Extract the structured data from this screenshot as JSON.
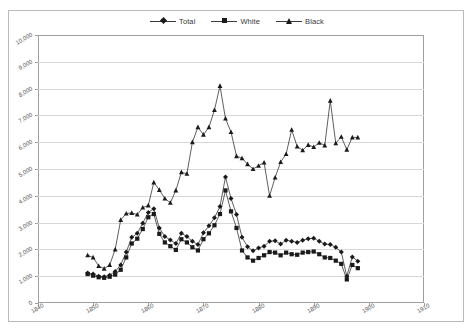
{
  "figure": {
    "background": "#ffffff",
    "frame_color": "#b9b9b9",
    "plot_border_color": "#9f9f9f",
    "grid_color": "#d8d8d8",
    "series_color": "#1a1a1a"
  },
  "legend": {
    "position": "top-center",
    "items": [
      {
        "label": "Total",
        "marker": "diamond"
      },
      {
        "label": "White",
        "marker": "square"
      },
      {
        "label": "Black",
        "marker": "triangle"
      }
    ]
  },
  "chart_data": {
    "type": "line",
    "title": "",
    "subtitle": "",
    "xlabel": "",
    "ylabel": "",
    "xlim": [
      1840,
      1910
    ],
    "ylim": [
      0,
      10000
    ],
    "grid": true,
    "legend_position": "top-center",
    "xticks": [
      "1840",
      "1850",
      "1860",
      "1870",
      "1880",
      "1890",
      "1900",
      "1910"
    ],
    "xtick_values": [
      1840,
      1850,
      1860,
      1870,
      1880,
      1890,
      1900,
      1910
    ],
    "yticks": [
      "0",
      "1,000",
      "2,000",
      "3,000",
      "4,000",
      "5,000",
      "6,000",
      "7,000",
      "8,000",
      "9,000",
      "10,000"
    ],
    "ytick_values": [
      0,
      1000,
      2000,
      3000,
      4000,
      5000,
      6000,
      7000,
      8000,
      9000,
      10000
    ],
    "x": [
      1849,
      1850,
      1851,
      1852,
      1853,
      1854,
      1855,
      1856,
      1857,
      1858,
      1859,
      1860,
      1861,
      1862,
      1863,
      1864,
      1865,
      1866,
      1867,
      1868,
      1869,
      1870,
      1871,
      1872,
      1873,
      1874,
      1875,
      1876,
      1877,
      1878,
      1879,
      1880,
      1881,
      1882,
      1883,
      1884,
      1885,
      1886,
      1887,
      1888,
      1889,
      1890,
      1891,
      1892,
      1893,
      1894,
      1895,
      1896,
      1897,
      1898
    ],
    "series": [
      {
        "name": "Total",
        "marker": "diamond",
        "values": [
          1120,
          1080,
          1000,
          980,
          1040,
          1180,
          1420,
          1900,
          2450,
          2600,
          2980,
          3380,
          3520,
          2800,
          2480,
          2350,
          2220,
          2600,
          2480,
          2300,
          2180,
          2620,
          2880,
          3180,
          3600,
          4700,
          3900,
          3300,
          2450,
          2100,
          1950,
          2050,
          2120,
          2300,
          2320,
          2200,
          2340,
          2300,
          2260,
          2340,
          2400,
          2420,
          2300,
          2200,
          2180,
          2080,
          1900,
          1000,
          1720,
          1560
        ]
      },
      {
        "name": "White",
        "marker": "square",
        "values": [
          1080,
          1020,
          960,
          940,
          980,
          1060,
          1240,
          1700,
          2220,
          2400,
          2760,
          3200,
          3320,
          2580,
          2260,
          2120,
          1980,
          2380,
          2260,
          2080,
          1960,
          2380,
          2600,
          2900,
          3320,
          4200,
          3420,
          2800,
          1960,
          1700,
          1580,
          1680,
          1780,
          1900,
          1880,
          1780,
          1880,
          1820,
          1800,
          1880,
          1900,
          1920,
          1820,
          1700,
          1680,
          1580,
          1460,
          880,
          1420,
          1300
        ]
      },
      {
        "name": "Black",
        "marker": "triangle",
        "values": [
          1780,
          1700,
          1380,
          1280,
          1420,
          2000,
          3100,
          3340,
          3360,
          3300,
          3560,
          3640,
          4500,
          4220,
          3900,
          3740,
          4200,
          4880,
          4820,
          6000,
          6560,
          6280,
          6560,
          7200,
          8100,
          6880,
          6380,
          5480,
          5400,
          5180,
          5000,
          5120,
          5240,
          4000,
          4680,
          5260,
          5560,
          6460,
          5840,
          5700,
          5900,
          5820,
          5980,
          5880,
          7550,
          5960,
          6200,
          5720,
          6180,
          6180
        ]
      }
    ]
  }
}
